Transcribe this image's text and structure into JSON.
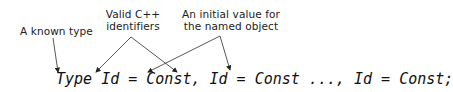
{
  "labels": {
    "type": "A known type",
    "identifiers_line1": "Valid C++",
    "identifiers_line2": "identifiers",
    "value_line1": "An initial value for",
    "value_line2": "the named object"
  },
  "code": "Type Id = Const, Id = Const ..., Id = Const;"
}
